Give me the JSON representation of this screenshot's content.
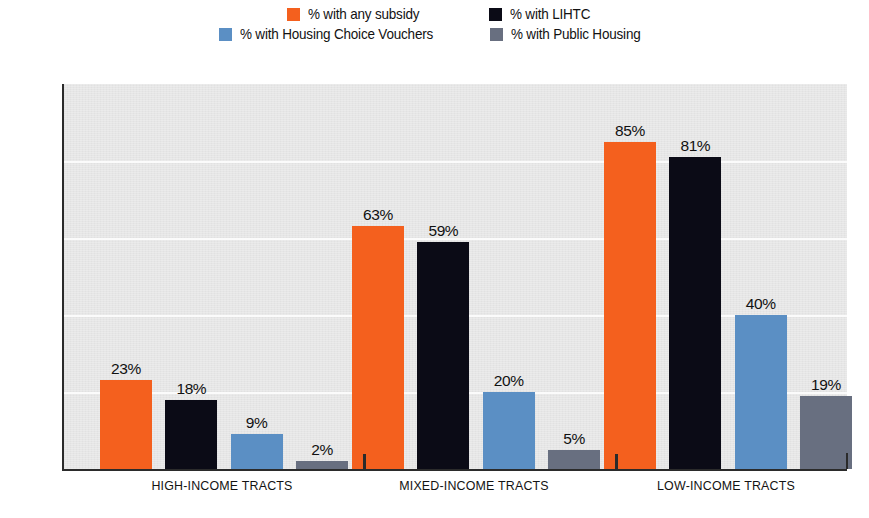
{
  "chart_data": {
    "type": "bar",
    "title": "",
    "subtitle": "",
    "xlabel": "",
    "ylabel": "",
    "ylim": [
      0,
      100
    ],
    "ytick_labels": [
      "100%",
      "80%",
      "60%",
      "40%",
      "20%",
      "0%"
    ],
    "ytick_values": [
      100,
      80,
      60,
      40,
      20,
      0
    ],
    "grid": "horizontal",
    "legend_position": "top-center",
    "categories": [
      "HIGH-INCOME TRACTS",
      "MIXED-INCOME TRACTS",
      "LOW-INCOME TRACTS"
    ],
    "series": [
      {
        "name": "% with any subsidy",
        "color": "#f4601e",
        "values": [
          23,
          59,
          85
        ],
        "value_labels": [
          "23%",
          "63%",
          "85%"
        ]
      },
      {
        "name": "% with LIHTC",
        "color": "#0b0b16",
        "values": [
          18,
          59,
          81
        ],
        "value_labels": [
          "18%",
          "59%",
          "81%"
        ]
      },
      {
        "name": "% with Housing Choice Vouchers",
        "color": "#5b8fc4",
        "values": [
          9,
          20,
          40
        ],
        "value_labels": [
          "9%",
          "20%",
          "40%"
        ]
      },
      {
        "name": "% with Public Housing",
        "color": "#686f80",
        "values": [
          2,
          5,
          19
        ],
        "value_labels": [
          "2%",
          "5%",
          "19%"
        ]
      }
    ],
    "data_by_group": [
      {
        "category": "HIGH-INCOME TRACTS",
        "any_subsidy": 23,
        "lihtc": 18,
        "vouchers": 9,
        "public_housing": 2
      },
      {
        "category": "MIXED-INCOME TRACTS",
        "any_subsidy": 63,
        "lihtc": 59,
        "vouchers": 20,
        "public_housing": 5
      },
      {
        "category": "LOW-INCOME TRACTS",
        "any_subsidy": 85,
        "lihtc": 81,
        "vouchers": 40,
        "public_housing": 19
      }
    ]
  },
  "legend": {
    "rows": [
      [
        {
          "label": "% with any subsidy",
          "color": "#f4601e"
        },
        {
          "label": "% with LIHTC",
          "color": "#0b0b16"
        }
      ],
      [
        {
          "label": "% with Housing Choice Vouchers",
          "color": "#5b8fc4"
        },
        {
          "label": "% with Public Housing",
          "color": "#686f80"
        }
      ]
    ]
  },
  "colors": {
    "plot_background": "#e6e6e6",
    "gridline": "#fbfbfb",
    "axis": "#2b2b2b",
    "page_background": "#ffffff",
    "text": "#121212"
  }
}
